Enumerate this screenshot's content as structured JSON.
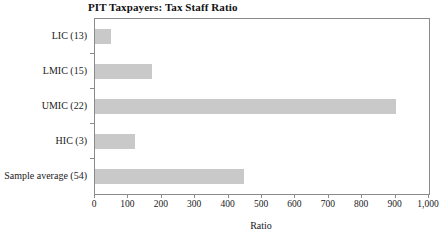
{
  "chart_data": {
    "type": "bar",
    "orientation": "horizontal",
    "title": "PIT Taxpayers: Tax Staff Ratio",
    "xlabel": "Ratio",
    "ylabel": "",
    "categories": [
      "LIC (13)",
      "LMIC (15)",
      "UMIC (22)",
      "HIC (3)",
      "Sample average (54)"
    ],
    "values": [
      48,
      171,
      900,
      120,
      446
    ],
    "xlim": [
      0,
      1000
    ],
    "xticks": [
      0,
      100,
      200,
      300,
      400,
      500,
      600,
      700,
      800,
      900,
      1000
    ],
    "xticklabels": [
      "0",
      "100",
      "200",
      "300",
      "400",
      "500",
      "600",
      "700",
      "800",
      "900",
      "1,000"
    ],
    "grid": false,
    "legend": false,
    "bar_color": "#c9c9c9",
    "axis_color": "#8a8a8a"
  }
}
